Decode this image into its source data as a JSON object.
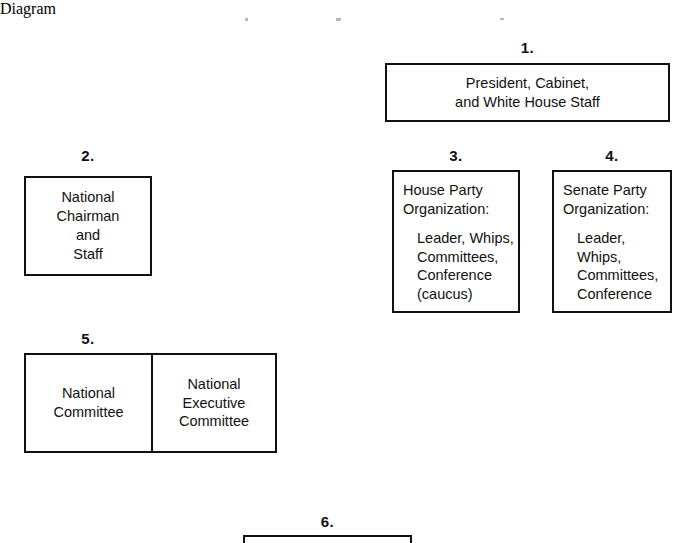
{
  "diagram": {
    "type": "organization-chart",
    "text_color": "#111111",
    "border_color": "#111111",
    "background_color": "#ffffff",
    "nodes": [
      {
        "id": "node-1",
        "label": "1.",
        "style": "centered",
        "lines": [
          "President, Cabinet,",
          "and White House Staff"
        ]
      },
      {
        "id": "node-2",
        "label": "2.",
        "style": "centered",
        "lines": [
          "National",
          "Chairman",
          "and",
          "Staff"
        ]
      },
      {
        "id": "node-3",
        "label": "3.",
        "style": "heading-with-list",
        "heading": [
          "House Party",
          "Organization:"
        ],
        "list": [
          "Leader, Whips,",
          "Committees,",
          "Conference",
          "(caucus)"
        ]
      },
      {
        "id": "node-4",
        "label": "4.",
        "style": "heading-with-list",
        "heading": [
          "Senate Party",
          "Organization:"
        ],
        "list": [
          "Leader, Whips,",
          "Committees,",
          "Conference"
        ]
      },
      {
        "id": "node-5",
        "label": "5.",
        "style": "split",
        "cells": [
          {
            "lines": [
              "National",
              "Committee"
            ]
          },
          {
            "lines": [
              "National",
              "Executive",
              "Committee"
            ]
          }
        ]
      },
      {
        "id": "node-6",
        "label": "6.",
        "style": "clipped",
        "note": "box cropped by bottom edge of image; no text visible"
      }
    ]
  }
}
